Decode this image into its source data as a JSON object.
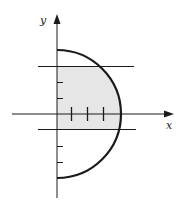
{
  "diagram": {
    "axes": {
      "x_label": "x",
      "y_label": "y"
    },
    "colors": {
      "ink": "#1a1a1a",
      "shade": "#e6e6e6",
      "background": "#ffffff"
    },
    "circle": {
      "center": [
        0,
        0
      ],
      "radius": 4,
      "half": "right"
    },
    "y_ticks": [
      -3,
      -2,
      -1,
      1,
      2,
      3
    ],
    "x_ticks": [
      1,
      2,
      3
    ],
    "horizontal_lines_y": [
      3,
      -1
    ],
    "shaded_region": {
      "y_from": -1,
      "y_to": 3,
      "bounded_by": "y-axis and semicircle"
    }
  }
}
